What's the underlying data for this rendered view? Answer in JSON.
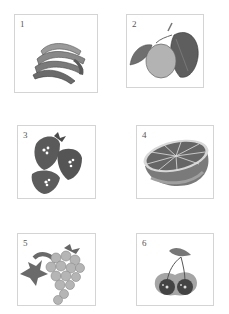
{
  "cards": [
    {
      "number": "1",
      "fruit": "bananas"
    },
    {
      "number": "2",
      "fruit": "apple-with-leaves"
    },
    {
      "number": "3",
      "fruit": "strawberries"
    },
    {
      "number": "4",
      "fruit": "orange-half"
    },
    {
      "number": "5",
      "fruit": "grapes"
    },
    {
      "number": "6",
      "fruit": "cherries"
    }
  ],
  "colors": {
    "border": "#d4d4d4",
    "dark_fill": "#5a5a5a",
    "mid_fill": "#8a8a8a",
    "light_fill": "#b8b8b8"
  }
}
